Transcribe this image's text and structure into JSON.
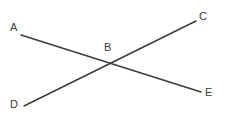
{
  "figure": {
    "width": 227,
    "height": 124,
    "background_color": "#ffffff",
    "stroke_color": "#3a3a3a",
    "label_color": "#3a3a3a",
    "stroke_width": 1.4
  },
  "labels": {
    "a": "A",
    "b": "B",
    "c": "C",
    "d": "D",
    "e": "E"
  },
  "points": [
    {
      "name": "A",
      "label": "A",
      "x": 14,
      "y": 28,
      "role": "segment-endpoint"
    },
    {
      "name": "B",
      "label": "B",
      "x": 112,
      "y": 67,
      "role": "intersection"
    },
    {
      "name": "C",
      "label": "C",
      "x": 203,
      "y": 17,
      "role": "segment-endpoint"
    },
    {
      "name": "D",
      "label": "D",
      "x": 14,
      "y": 105,
      "role": "segment-endpoint"
    },
    {
      "name": "E",
      "label": "E",
      "x": 209,
      "y": 93,
      "role": "segment-endpoint"
    }
  ],
  "segments": [
    {
      "name": "segment-ae",
      "from": "A",
      "to": "E",
      "x1": 21,
      "y1": 35,
      "x2": 201,
      "y2": 92
    },
    {
      "name": "segment-dc",
      "from": "D",
      "to": "C",
      "x1": 24,
      "y1": 106,
      "x2": 196,
      "y2": 21
    }
  ],
  "label_positions": {
    "a": {
      "left": 10,
      "top": 22
    },
    "b": {
      "left": 104,
      "top": 42
    },
    "c": {
      "left": 199,
      "top": 11
    },
    "d": {
      "left": 10,
      "top": 99
    },
    "e": {
      "left": 205,
      "top": 87
    }
  }
}
